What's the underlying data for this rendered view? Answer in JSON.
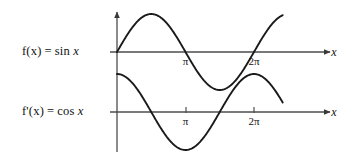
{
  "figure": {
    "background_color": "#ffffff",
    "curve_color": "#1a1a1a",
    "axis_color": "#4d4d4d",
    "labels": {
      "f_name": "f(x)",
      "f_equals": "=",
      "f_expr_fn": "sin",
      "f_expr_var": "x",
      "fprime_name": "f'(x)",
      "fprime_equals": "=",
      "fprime_expr_fn": "cos",
      "fprime_expr_var": "x"
    },
    "top_plot": {
      "x_axis_label": "x",
      "ticks": [
        {
          "label": "π",
          "value": 3.14159
        },
        {
          "label": "2π",
          "value": 6.28319
        }
      ]
    },
    "bottom_plot": {
      "x_axis_label": "x",
      "ticks": [
        {
          "label": "π",
          "value": 3.14159
        },
        {
          "label": "2π",
          "value": 6.28319
        }
      ]
    }
  },
  "chart_data": [
    {
      "type": "line",
      "title": "f(x) = sin x",
      "xlabel": "x",
      "ylabel": "",
      "function": "sin",
      "xlim": [
        -0.15,
        7.75
      ],
      "ylim": [
        -1.35,
        1.35
      ],
      "xtick_values": [
        3.14159,
        6.28319
      ],
      "xtick_labels": [
        "π",
        "2π"
      ],
      "grid": false,
      "legend": "none",
      "x": [
        0,
        0.3927,
        0.7854,
        1.1781,
        1.5708,
        1.9635,
        2.3562,
        2.7489,
        3.14159,
        3.5343,
        3.927,
        4.3197,
        4.7124,
        5.1051,
        5.4978,
        5.8905,
        6.28319,
        6.6759,
        7.0686,
        7.4613
      ],
      "values": [
        0,
        0.3827,
        0.7071,
        0.9239,
        1,
        0.9239,
        0.7071,
        0.3827,
        0,
        -0.3827,
        -0.7071,
        -0.9239,
        -1,
        -0.9239,
        -0.7071,
        -0.3827,
        0,
        0.3827,
        0.7071,
        0.9239
      ]
    },
    {
      "type": "line",
      "title": "f'(x) = cos x",
      "xlabel": "x",
      "ylabel": "",
      "function": "cos",
      "xlim": [
        -0.15,
        7.75
      ],
      "ylim": [
        -1.35,
        1.35
      ],
      "xtick_values": [
        3.14159,
        6.28319
      ],
      "xtick_labels": [
        "π",
        "2π"
      ],
      "grid": false,
      "legend": "none",
      "x": [
        0,
        0.3927,
        0.7854,
        1.1781,
        1.5708,
        1.9635,
        2.3562,
        2.7489,
        3.14159,
        3.5343,
        3.927,
        4.3197,
        4.7124,
        5.1051,
        5.4978,
        5.8905,
        6.28319,
        6.6759,
        7.0686,
        7.4613
      ],
      "values": [
        1,
        0.9239,
        0.7071,
        0.3827,
        0,
        -0.3827,
        -0.7071,
        -0.9239,
        -1,
        -0.9239,
        -0.7071,
        -0.3827,
        0,
        0.3827,
        0.7071,
        0.9239,
        1,
        0.9239,
        0.7071,
        0.3827
      ]
    }
  ]
}
